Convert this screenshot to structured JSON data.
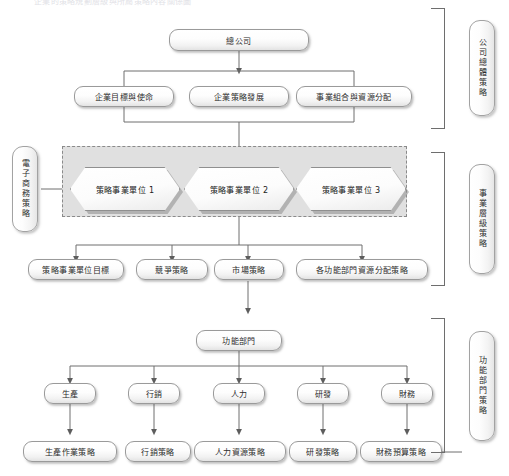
{
  "page": {
    "top_caption": "企業的策略規劃層級與所屬策略內容關係圖",
    "background_color": "#ffffff",
    "band_fill_color": "#e0e0e0",
    "line_color": "#6e6e6e"
  },
  "left_label": {
    "text": "電子商務策略"
  },
  "right_brackets": [
    {
      "label": "公司總體策略"
    },
    {
      "label": "事業層級策略"
    },
    {
      "label": "功能部門策略"
    }
  ],
  "levels": {
    "corporate": {
      "root": "總公司",
      "children": [
        "企業目標與使命",
        "企業策略發展",
        "事業組合與資源分配"
      ]
    },
    "business": {
      "units": [
        "策略事業單位 1",
        "策略事業單位 2",
        "策略事業單位 3"
      ],
      "outputs": [
        "策略事業單位目標",
        "競爭策略",
        "市場策略",
        "各功能部門資源分配策略"
      ]
    },
    "functional": {
      "root": "功能部門",
      "departments": [
        "生產",
        "行銷",
        "人力",
        "研發",
        "財務"
      ],
      "strategies": [
        "生產作業策略",
        "行銷策略",
        "人力資源策略",
        "研發策略",
        "財務預算策略"
      ]
    }
  }
}
